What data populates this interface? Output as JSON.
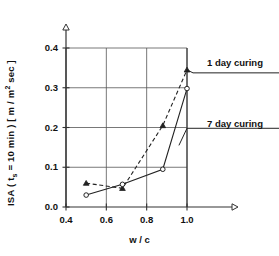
{
  "chart_data": {
    "type": "line",
    "title": "",
    "subtitle": "",
    "xlabel": "w / c",
    "ylabel_main": "ISA (  t",
    "ylabel_sub": "s",
    "ylabel_rest": " = 10 min )  [ m / m",
    "ylabel_sup": "2",
    "ylabel_tail": " sec ]",
    "ylabel_plain": "ISA ( ts = 10 min ) [ m / m2 sec ]",
    "xlim": [
      0.4,
      1.1
    ],
    "ylim": [
      0.0,
      0.44
    ],
    "plot_xlim": [
      0.4,
      1.0
    ],
    "plot_ylim": [
      0.0,
      0.4
    ],
    "xticks": [
      "0.4",
      "0.6",
      "0.8",
      "1.0"
    ],
    "xtick_values": [
      0.4,
      0.6,
      0.8,
      1.0
    ],
    "yticks": [
      "0.0",
      "0.1",
      "0.2",
      "0.3",
      "0.4"
    ],
    "ytick_values": [
      0.0,
      0.1,
      0.2,
      0.3,
      0.4
    ],
    "grid": true,
    "grid_x_values": [
      0.6,
      0.8,
      1.0
    ],
    "grid_y_values": [
      0.1,
      0.2,
      0.3,
      0.4
    ],
    "legend_position": "right-annotations",
    "series": [
      {
        "name": "1 day curing",
        "style": "dashed",
        "marker": "triangle",
        "x": [
          0.5,
          0.68,
          0.88,
          1.0
        ],
        "values": [
          0.06,
          0.047,
          0.205,
          0.345
        ]
      },
      {
        "name": "7 day curing",
        "style": "solid",
        "marker": "circle",
        "x": [
          0.5,
          0.68,
          0.88,
          1.0
        ],
        "values": [
          0.03,
          0.057,
          0.095,
          0.298
        ]
      }
    ],
    "annotations": [
      {
        "label": "1 day curing",
        "points_to_series": "1 day curing",
        "points_to_x": 1.0,
        "points_to_y": 0.345
      },
      {
        "label": "7 day curing",
        "points_to_series": "7 day curing",
        "points_to_x": 0.96,
        "points_to_y": 0.155
      }
    ]
  }
}
